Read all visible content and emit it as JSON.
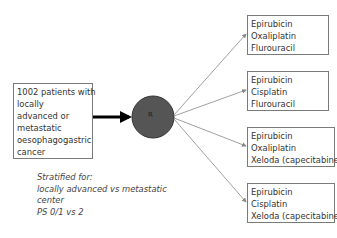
{
  "population": {
    "lines": [
      "1002 patients with",
      "locally",
      "advanced or",
      "metastatic",
      "oesophagogastric",
      "cancer"
    ]
  },
  "randomisation": {
    "label": "R",
    "color": "#555555"
  },
  "stratification": {
    "lines": [
      "Stratified for:",
      "locally advanced vs metastatic",
      "center",
      "PS 0/1 vs 2"
    ]
  },
  "arms": [
    {
      "lines": [
        "Epirubicin",
        "Oxaliplatin",
        "Flurouracil"
      ]
    },
    {
      "lines": [
        "Epirubicin",
        "Cisplatin",
        "Flurouracil"
      ]
    },
    {
      "lines": [
        "Epirubicin",
        "Oxaliplatin",
        "Xeloda (capecitabine)"
      ]
    },
    {
      "lines": [
        "Epirubicin",
        "Cisplatin",
        "Xeloda (capecitabine)"
      ]
    }
  ]
}
